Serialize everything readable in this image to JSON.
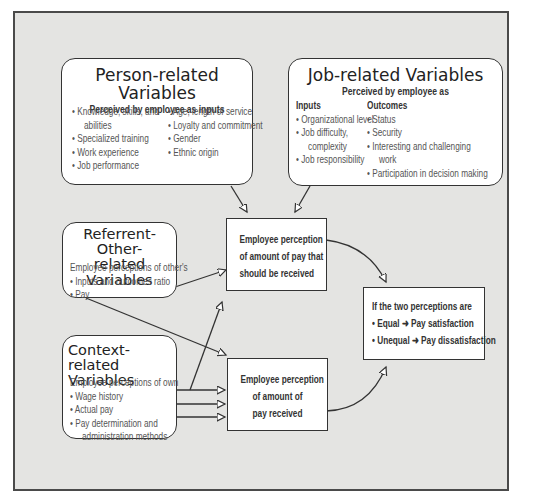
{
  "person_box": {
    "title": "Person-related Variables",
    "subtitle": "Perceived by employee as inputs",
    "col1": [
      "• Knowledge, skills, and",
      "abilities",
      "• Specialized training",
      "• Work experience",
      "• Job performance"
    ],
    "col2": [
      "• Age, length of service",
      "• Loyalty and commitment",
      "• Gender",
      "• Ethnic origin"
    ]
  },
  "job_box": {
    "title": "Job-related Variables",
    "subtitle": "Perceived by employee as",
    "inputs_header": "Inputs",
    "inputs": [
      "• Organizational level",
      "• Job difficulty,",
      "complexity",
      "• Job responsibility"
    ],
    "outcomes_header": "Outcomes",
    "outcomes": [
      "• Status",
      "• Security",
      "• Interesting and challenging",
      "work",
      "• Participation in decision making"
    ]
  },
  "referent_box": {
    "title_line1": "Referrent-Other-",
    "title_line2": "related Variables",
    "intro": "Employee perceptions of other's",
    "items": [
      "• Inputs and outcomes ratio",
      "• Pay"
    ]
  },
  "context_box": {
    "title_line1": "Context-related",
    "title_line2": "Variables",
    "intro": "Employee perceptions of own",
    "items": [
      "• Wage history",
      "• Actual pay",
      "• Pay determination and",
      "administration methods"
    ]
  },
  "should_box": {
    "lines": [
      "Employee perception",
      "of amount of pay that",
      "should be received"
    ]
  },
  "received_box": {
    "lines": [
      "Employee perception",
      "of amount of",
      "pay received"
    ]
  },
  "result_box": {
    "header": "If the two perceptions are",
    "equal": "• Equal ➜ Pay satisfaction",
    "unequal": "• Unequal ➜ Pay dissatisfaction"
  },
  "colors": {
    "background": "#e4e4e2",
    "border": "#4a4a4a",
    "box": "#ffffff"
  }
}
